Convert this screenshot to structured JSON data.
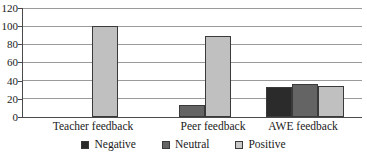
{
  "chart_data": {
    "type": "bar",
    "title": "",
    "xlabel": "",
    "ylabel": "",
    "ylim": [
      0,
      120
    ],
    "yticks": [
      0,
      20,
      40,
      60,
      80,
      100,
      120
    ],
    "grid": true,
    "legend_position": "bottom",
    "categories": [
      "Teacher feedback",
      "Peer feedback",
      "AWE feedback"
    ],
    "series": [
      {
        "name": "Negative",
        "color": "#2b2b2b",
        "values": [
          0,
          0,
          33
        ]
      },
      {
        "name": "Neutral",
        "color": "#646464",
        "values": [
          0,
          13,
          36
        ]
      },
      {
        "name": "Positive",
        "color": "#c0c0c0",
        "values": [
          100,
          89,
          34
        ]
      }
    ]
  },
  "axis": {
    "ytick_labels": [
      "0",
      "20",
      "40",
      "60",
      "80",
      "100",
      "120"
    ]
  },
  "legend": {
    "items": [
      {
        "label": "Negative"
      },
      {
        "label": "Neutral"
      },
      {
        "label": "Positive"
      }
    ]
  }
}
